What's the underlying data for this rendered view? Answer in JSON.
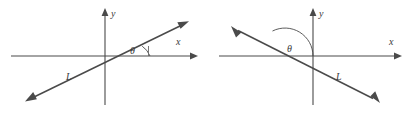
{
  "figure": {
    "background_color": "#ffffff",
    "stroke_color": "#4a4a4a",
    "label_color": "#3a3a3a",
    "panel_count": 2
  },
  "panels": [
    {
      "id": "left-panel",
      "description": "line with positive slope crossing origin, acute angle theta measured from positive x-axis",
      "angle_type": "acute",
      "slope_sign": "positive",
      "axes": {
        "x_label": "x",
        "y_label": "y",
        "x_start": [
          11,
          56
        ],
        "x_end": [
          196,
          56
        ],
        "y_start": [
          105,
          105
        ],
        "y_end": [
          105,
          10
        ]
      },
      "line": {
        "label": "L",
        "label_pos": [
          66,
          80
        ],
        "from": [
          28,
          100
        ],
        "to": [
          186,
          23
        ]
      },
      "angle": {
        "label": "θ",
        "label_pos": [
          129,
          54
        ],
        "vertex": [
          129,
          56
        ],
        "arc_radius": 24
      }
    },
    {
      "id": "right-panel",
      "description": "line with negative slope crossing x-axis left of origin, obtuse angle theta measured from positive x-axis",
      "angle_type": "obtuse",
      "slope_sign": "negative",
      "axes": {
        "x_label": "x",
        "y_label": "y",
        "x_start": [
          219,
          56
        ],
        "x_end": [
          400,
          56
        ],
        "y_start": [
          313,
          105
        ],
        "y_end": [
          313,
          10
        ]
      },
      "line": {
        "label": "L",
        "label_pos": [
          337,
          80
        ],
        "from": [
          233,
          28
        ],
        "to": [
          378,
          101
        ]
      },
      "angle": {
        "label": "θ",
        "label_pos": [
          292,
          52
        ],
        "vertex": [
          285,
          56
        ],
        "arc_radius": 28
      }
    }
  ],
  "icon_names": {
    "x_axis_arrow": "arrow-right-icon",
    "y_axis_arrow": "arrow-up-icon",
    "line_arrow_a": "arrow-head-icon",
    "line_arrow_b": "arrow-head-icon",
    "angle_arc": "angle-arc-icon"
  }
}
